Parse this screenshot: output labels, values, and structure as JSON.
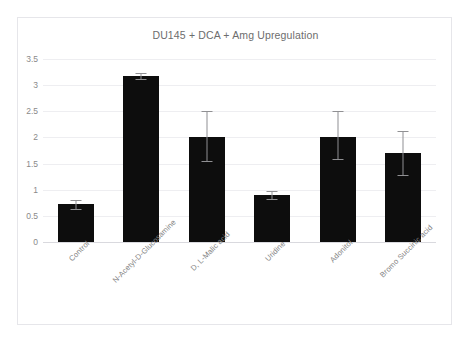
{
  "clipped_header_text": "",
  "chart": {
    "title": "DU145 + DCA + Amg Upregulation",
    "frame_color": "#e6e6ea",
    "bar_color": "#0d0d0d",
    "error_bar_color": "#909093",
    "gridline_color": "#eeeef1"
  },
  "chart_data": {
    "type": "bar",
    "title": "DU145 + DCA + Amg Upregulation",
    "xlabel": "",
    "ylabel": "",
    "ylim": [
      0,
      3.5
    ],
    "yticks": [
      "0",
      "0.5",
      "1",
      "1.5",
      "2",
      "2.5",
      "3",
      "3.5"
    ],
    "ytick_values": [
      0,
      0.5,
      1,
      1.5,
      2,
      2.5,
      3,
      3.5
    ],
    "grid": true,
    "legend": false,
    "categories": [
      "Control",
      "N-Acetyl-D-Glucosamine",
      "D, L-Malic acid",
      "Uridine",
      "Adonitol",
      "Bromo Succinic acid"
    ],
    "values": [
      0.72,
      3.17,
      2.0,
      0.9,
      2.0,
      1.7
    ],
    "error_upper": [
      0.08,
      0.06,
      0.5,
      0.07,
      0.5,
      0.42
    ],
    "error_lower": [
      0.08,
      0.06,
      0.45,
      0.07,
      0.42,
      0.42
    ]
  }
}
